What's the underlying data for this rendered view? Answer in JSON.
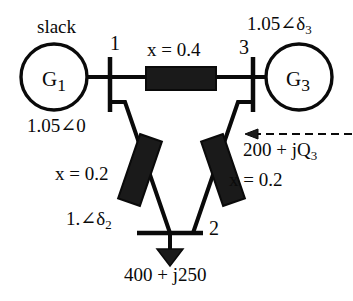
{
  "diagram": {
    "type": "power-system-one-line",
    "stroke_color": "#0a0a0a",
    "fill_color": "#1a1a1a",
    "background": "#ffffff",
    "generators": [
      {
        "id": "G1",
        "label": "G",
        "subscript": "1",
        "bus": "1",
        "note": "slack"
      },
      {
        "id": "G3",
        "label": "G",
        "subscript": "3",
        "bus": "3",
        "note": ""
      }
    ],
    "buses": [
      {
        "id": "1",
        "number": "1",
        "voltage_label": "1.05∠0",
        "orientation": "vertical"
      },
      {
        "id": "2",
        "number": "2",
        "voltage_label": "1.∠δ",
        "voltage_sub": "2",
        "orientation": "horizontal"
      },
      {
        "id": "3",
        "number": "3",
        "voltage_label": "1.05∠δ",
        "voltage_sub": "3",
        "orientation": "vertical"
      }
    ],
    "branches": [
      {
        "from": "1",
        "to": "3",
        "reactance_label": "x = 0.4",
        "value": 0.4
      },
      {
        "from": "1",
        "to": "2",
        "reactance_label": "x = 0.2",
        "value": 0.2
      },
      {
        "from": "3",
        "to": "2",
        "reactance_label": "x = 0.2",
        "value": 0.2
      }
    ],
    "labels": {
      "slack": "slack",
      "bus1_number": "1",
      "bus2_number": "2",
      "bus3_number": "3",
      "gen1_name": "G",
      "gen1_sub": "1",
      "gen3_name": "G",
      "gen3_sub": "3",
      "line13_reactance": "x = 0.4",
      "line12_reactance": "x = 0.2",
      "line32_reactance": "x = 0.2",
      "bus1_voltage": "1.05∠0",
      "bus2_voltage_main": "1.∠δ",
      "bus2_voltage_sub": "2",
      "bus3_voltage_main": "1.05∠δ",
      "bus3_voltage_sub": "3",
      "injection_main": "200 + jQ",
      "injection_sub": "3",
      "load_power": "400 + j250"
    }
  }
}
